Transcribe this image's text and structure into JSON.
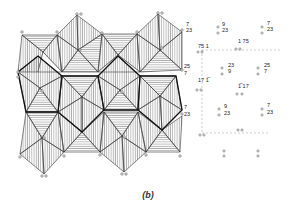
{
  "figure": {
    "caption": "(b)",
    "colors": {
      "line": "#333333",
      "bold_line": "#111111",
      "hatch": "#555555",
      "background": "#ffffff"
    }
  },
  "height_labels": [
    {
      "id": "l1",
      "text": "7",
      "x": 184,
      "y": 25
    },
    {
      "id": "l2",
      "text": "23",
      "x": 184,
      "y": 31
    },
    {
      "id": "l3",
      "text": "9",
      "x": 220,
      "y": 25
    },
    {
      "id": "l4",
      "text": "23",
      "x": 220,
      "y": 31
    },
    {
      "id": "l5",
      "text": "7",
      "x": 265,
      "y": 24
    },
    {
      "id": "l6",
      "text": "23",
      "x": 265,
      "y": 30
    },
    {
      "id": "l7",
      "text": "75 1",
      "x": 196,
      "y": 47
    },
    {
      "id": "l8",
      "text": "1  75",
      "x": 236,
      "y": 42
    },
    {
      "id": "l9",
      "text": "25",
      "x": 182,
      "y": 67
    },
    {
      "id": "l10",
      "text": "7",
      "x": 182,
      "y": 74
    },
    {
      "id": "l11",
      "text": "23",
      "x": 226,
      "y": 66
    },
    {
      "id": "l12",
      "text": "9",
      "x": 226,
      "y": 72
    },
    {
      "id": "l13",
      "text": "25",
      "x": 262,
      "y": 66
    },
    {
      "id": "l14",
      "text": "7",
      "x": 262,
      "y": 72
    },
    {
      "id": "l15",
      "text": "17 1̅",
      "x": 196,
      "y": 81
    },
    {
      "id": "l16",
      "text": "1̅  17",
      "x": 236,
      "y": 87
    },
    {
      "id": "l17",
      "text": "7",
      "x": 182,
      "y": 108
    },
    {
      "id": "l18",
      "text": "23",
      "x": 182,
      "y": 115
    },
    {
      "id": "l19",
      "text": "9",
      "x": 222,
      "y": 107
    },
    {
      "id": "l20",
      "text": "23",
      "x": 222,
      "y": 114
    },
    {
      "id": "l21",
      "text": "7",
      "x": 265,
      "y": 106
    },
    {
      "id": "l22",
      "text": "23",
      "x": 265,
      "y": 113
    }
  ]
}
